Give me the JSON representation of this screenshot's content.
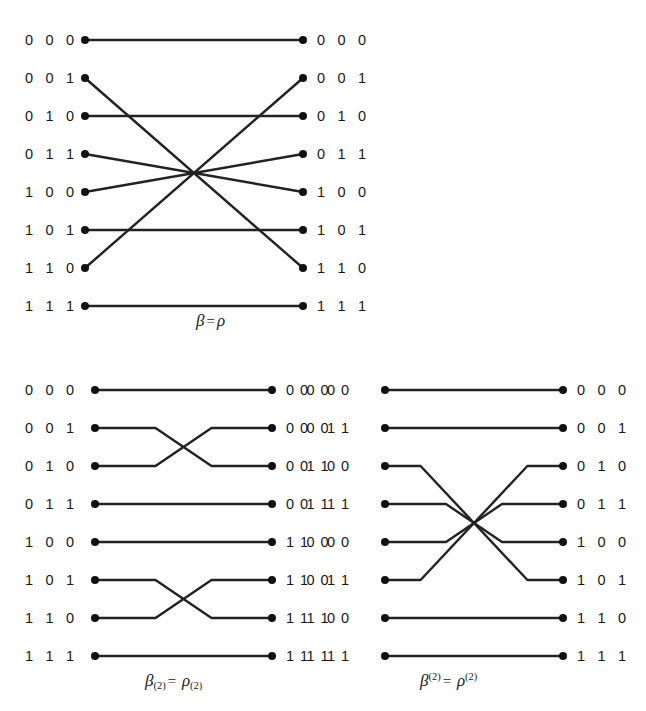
{
  "figure": {
    "line_color": "#222222",
    "node_color": "#111111",
    "background": "#ffffff"
  },
  "labels": {
    "nodes": [
      "0 0 0",
      "0 0 1",
      "0 1 0",
      "0 1 1",
      "1 0 0",
      "1 0 1",
      "1 1 0",
      "1 1 1"
    ]
  },
  "diagrams": [
    {
      "id": "top",
      "name": "beta-equals-rho",
      "caption": {
        "left_symbol": "β",
        "left_sub": "",
        "left_sup": "",
        "equals": "=",
        "right_symbol": "ρ",
        "right_sub": "",
        "right_sup": "",
        "plain": "β = ρ"
      },
      "left_labels": [
        "0 0 0",
        "0 0 1",
        "0 1 0",
        "0 1 1",
        "1 0 0",
        "1 0 1",
        "1 1 0",
        "1 1 1"
      ],
      "right_labels": [
        "0 0 0",
        "0 0 1",
        "0 1 0",
        "0 1 1",
        "1 0 0",
        "1 0 1",
        "1 1 0",
        "1 1 1"
      ],
      "style": "straight",
      "mapping": [
        {
          "from": "0 0 0",
          "to": "0 0 0",
          "from_index": 0,
          "to_index": 0
        },
        {
          "from": "0 0 1",
          "to": "1 1 0",
          "from_index": 1,
          "to_index": 6
        },
        {
          "from": "0 1 0",
          "to": "0 1 0",
          "from_index": 2,
          "to_index": 2
        },
        {
          "from": "0 1 1",
          "to": "1 0 0",
          "from_index": 3,
          "to_index": 4
        },
        {
          "from": "1 0 0",
          "to": "0 1 1",
          "from_index": 4,
          "to_index": 3
        },
        {
          "from": "1 0 1",
          "to": "1 0 1",
          "from_index": 5,
          "to_index": 5
        },
        {
          "from": "1 1 0",
          "to": "0 0 1",
          "from_index": 6,
          "to_index": 1
        },
        {
          "from": "1 1 1",
          "to": "1 1 1",
          "from_index": 7,
          "to_index": 7
        }
      ]
    },
    {
      "id": "bottom-left",
      "name": "beta-sub-2-equals-rho-sub-2",
      "caption": {
        "left_symbol": "β",
        "left_sub": "(2)",
        "left_sup": "",
        "equals": "=",
        "right_symbol": "ρ",
        "right_sub": "(2)",
        "right_sup": "",
        "plain": "β(2) = ρ(2)"
      },
      "left_labels": [
        "0 0 0",
        "0 0 1",
        "0 1 0",
        "0 1 1",
        "1 0 0",
        "1 0 1",
        "1 1 0",
        "1 1 1"
      ],
      "right_labels": [
        "0 0 0",
        "0 0 1",
        "0 1 0",
        "0 1 1",
        "1 0 0",
        "1 0 1",
        "1 1 0",
        "1 1 1"
      ],
      "style": "orthogonal",
      "mapping": [
        {
          "from": "0 0 0",
          "to": "0 0 0",
          "from_index": 0,
          "to_index": 0
        },
        {
          "from": "0 0 1",
          "to": "0 1 0",
          "from_index": 1,
          "to_index": 2
        },
        {
          "from": "0 1 0",
          "to": "0 0 1",
          "from_index": 2,
          "to_index": 1
        },
        {
          "from": "0 1 1",
          "to": "0 1 1",
          "from_index": 3,
          "to_index": 3
        },
        {
          "from": "1 0 0",
          "to": "1 0 0",
          "from_index": 4,
          "to_index": 4
        },
        {
          "from": "1 0 1",
          "to": "1 1 0",
          "from_index": 5,
          "to_index": 6
        },
        {
          "from": "1 1 0",
          "to": "1 0 1",
          "from_index": 6,
          "to_index": 5
        },
        {
          "from": "1 1 1",
          "to": "1 1 1",
          "from_index": 7,
          "to_index": 7
        }
      ]
    },
    {
      "id": "bottom-right",
      "name": "beta-sup-2-equals-rho-sup-2",
      "caption": {
        "left_symbol": "β",
        "left_sub": "",
        "left_sup": "(2)",
        "equals": "=",
        "right_symbol": "ρ",
        "right_sub": "",
        "right_sup": "(2)",
        "plain": "β(2) = ρ(2)"
      },
      "left_labels": [
        "0 0 0",
        "0 0 1",
        "0 1 0",
        "0 1 1",
        "1 0 0",
        "1 0 1",
        "1 1 0",
        "1 1 1"
      ],
      "right_labels": [
        "0 0 0",
        "0 0 1",
        "0 1 0",
        "0 1 1",
        "1 0 0",
        "1 0 1",
        "1 1 0",
        "1 1 1"
      ],
      "style": "orthogonal",
      "mapping": [
        {
          "from": "0 0 0",
          "to": "0 0 0",
          "from_index": 0,
          "to_index": 0
        },
        {
          "from": "0 0 1",
          "to": "0 0 1",
          "from_index": 1,
          "to_index": 1
        },
        {
          "from": "0 1 0",
          "to": "1 0 1",
          "from_index": 2,
          "to_index": 5
        },
        {
          "from": "0 1 1",
          "to": "1 0 0",
          "from_index": 3,
          "to_index": 4
        },
        {
          "from": "1 0 0",
          "to": "0 1 1",
          "from_index": 4,
          "to_index": 3
        },
        {
          "from": "1 0 1",
          "to": "0 1 0",
          "from_index": 5,
          "to_index": 2
        },
        {
          "from": "1 1 0",
          "to": "1 1 0",
          "from_index": 6,
          "to_index": 6
        },
        {
          "from": "1 1 1",
          "to": "1 1 1",
          "from_index": 7,
          "to_index": 7
        }
      ]
    }
  ]
}
